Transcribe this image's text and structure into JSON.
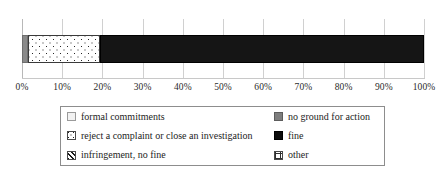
{
  "chart_data": {
    "type": "bar",
    "orientation": "horizontal",
    "stacked": true,
    "title": "",
    "subtitle": "",
    "xlabel": "",
    "ylabel": "",
    "grid": true,
    "legend_position": "bottom",
    "xlim": [
      0,
      100
    ],
    "categories": [
      ""
    ],
    "x_ticks": [
      0,
      10,
      20,
      30,
      40,
      50,
      60,
      70,
      80,
      90,
      100
    ],
    "x_tick_labels": [
      "0%",
      "10%",
      "20%",
      "30%",
      "40%",
      "50%",
      "60%",
      "70%",
      "80%",
      "90%",
      "100%"
    ],
    "series": [
      {
        "name": "formal commitments",
        "values": [
          0
        ],
        "pattern": "empty",
        "color": "#f2f2f2"
      },
      {
        "name": "no ground for action",
        "values": [
          1.5
        ],
        "pattern": "solid-gray",
        "color": "#8a8a8a"
      },
      {
        "name": "reject a complaint or close an investigation",
        "values": [
          18
        ],
        "pattern": "dots",
        "color": "#ffffff"
      },
      {
        "name": "fine",
        "values": [
          80.5
        ],
        "pattern": "solid-black",
        "color": "#151515"
      },
      {
        "name": "infringement, no fine",
        "values": [
          0
        ],
        "pattern": "hatch",
        "color": "#ffffff"
      },
      {
        "name": "other",
        "values": [
          0
        ],
        "pattern": "grid",
        "color": "#ffffff"
      }
    ]
  },
  "axis": {
    "ticks": [
      {
        "label": "0%",
        "pos": 0
      },
      {
        "label": "10%",
        "pos": 10
      },
      {
        "label": "20%",
        "pos": 20
      },
      {
        "label": "30%",
        "pos": 30
      },
      {
        "label": "40%",
        "pos": 40
      },
      {
        "label": "50%",
        "pos": 50
      },
      {
        "label": "60%",
        "pos": 60
      },
      {
        "label": "70%",
        "pos": 70
      },
      {
        "label": "80%",
        "pos": 80
      },
      {
        "label": "90%",
        "pos": 90
      },
      {
        "label": "100%",
        "pos": 100
      }
    ]
  },
  "bar": {
    "segments": [
      {
        "key": "no-ground-for-action",
        "start": 0,
        "width": 1.5,
        "style": "seg-solid-gray"
      },
      {
        "key": "reject-a-complaint",
        "start": 1.5,
        "width": 18,
        "style": "seg-dots"
      },
      {
        "key": "fine",
        "start": 19.5,
        "width": 80.5,
        "style": "seg-solid-black"
      }
    ]
  },
  "legend": {
    "columns": [
      {
        "items": [
          {
            "label": "formal commitments",
            "swatch": "sw-formal"
          },
          {
            "label": "reject a complaint or close an investigation",
            "swatch": "sw-reject"
          },
          {
            "label": "infringement, no fine",
            "swatch": "sw-infr"
          }
        ]
      },
      {
        "items": [
          {
            "label": "no ground for action",
            "swatch": "sw-noground"
          },
          {
            "label": "fine",
            "swatch": "sw-fine"
          },
          {
            "label": "other",
            "swatch": "sw-other"
          }
        ]
      }
    ]
  },
  "colors": {
    "solid_gray": "#8a8a8a",
    "solid_black": "#151515",
    "gridline": "#d0d0d0",
    "legend_border": "#8d8d8d",
    "text": "#1d1d1d",
    "background": "#ffffff"
  }
}
